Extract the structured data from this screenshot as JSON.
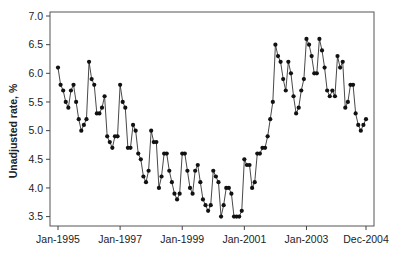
{
  "chart_data": {
    "type": "line",
    "title": "",
    "xlabel": "",
    "ylabel": "Unadjusted rate, %",
    "ylim": [
      3.5,
      7.0
    ],
    "yticks": [
      3.5,
      4.0,
      4.5,
      5.0,
      5.5,
      6.0,
      6.5,
      7.0
    ],
    "ytick_labels": [
      "3.5",
      "4.0",
      "4.5",
      "5.0",
      "5.5",
      "6.0",
      "6.5",
      "7.0"
    ],
    "xticks": [
      {
        "label": "Jan-1995",
        "index": 0
      },
      {
        "label": "Jan-1997",
        "index": 24
      },
      {
        "label": "Jan-1999",
        "index": 48
      },
      {
        "label": "Jan-2001",
        "index": 72
      },
      {
        "label": "Jan-2003",
        "index": 96
      },
      {
        "label": "Dec-2004",
        "index": 119
      }
    ],
    "x_range": [
      "Jan-1995",
      "Dec-2004"
    ],
    "frequency": "monthly",
    "grid": false,
    "legend": null,
    "marker": "filled-circle",
    "series": [
      {
        "name": "Unadjusted rate",
        "color": "#1a1a1a",
        "by_year": {
          "1995": [
            6.1,
            5.8,
            5.7,
            5.5,
            5.4,
            5.7,
            5.8,
            5.5,
            5.2,
            5.0,
            5.1,
            5.2
          ],
          "1996": [
            6.2,
            5.9,
            5.8,
            5.3,
            5.3,
            5.4,
            5.6,
            4.9,
            4.8,
            4.7,
            4.9,
            4.9
          ],
          "1997": [
            5.8,
            5.5,
            5.4,
            4.7,
            4.7,
            5.1,
            5.0,
            4.6,
            4.5,
            4.2,
            4.1,
            4.3
          ],
          "1998": [
            5.0,
            4.8,
            4.8,
            4.0,
            4.2,
            4.6,
            4.6,
            4.3,
            4.1,
            3.9,
            3.8,
            3.9
          ],
          "1999": [
            4.6,
            4.6,
            4.3,
            4.0,
            3.9,
            4.3,
            4.4,
            4.1,
            3.8,
            3.7,
            3.6,
            3.7
          ],
          "2000": [
            4.3,
            4.2,
            4.1,
            3.5,
            3.7,
            4.0,
            4.0,
            3.9,
            3.5,
            3.5,
            3.5,
            3.6
          ],
          "2001": [
            4.5,
            4.4,
            4.4,
            4.0,
            4.1,
            4.6,
            4.6,
            4.7,
            4.7,
            4.9,
            5.2,
            5.5
          ],
          "2002": [
            6.5,
            6.3,
            6.2,
            5.9,
            5.7,
            6.2,
            6.0,
            5.6,
            5.3,
            5.4,
            5.7,
            5.9
          ],
          "2003": [
            6.6,
            6.5,
            6.3,
            6.0,
            6.0,
            6.6,
            6.4,
            6.1,
            5.7,
            5.6,
            5.7,
            5.6
          ],
          "2004": [
            6.3,
            6.1,
            6.2,
            5.4,
            5.5,
            5.8,
            5.8,
            5.3,
            5.1,
            5.0,
            5.1,
            5.2
          ]
        }
      }
    ]
  },
  "layout": {
    "plot": {
      "left": 50,
      "top": 12,
      "right": 374,
      "bottom": 226
    },
    "y_px_top": 16,
    "y_px_bottom": 216.6,
    "x_px_first": 58,
    "x_px_last": 366,
    "line_color": "#333333",
    "marker_color": "#111111",
    "axis_color": "#444444"
  }
}
